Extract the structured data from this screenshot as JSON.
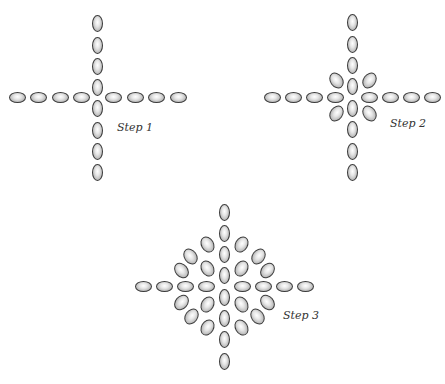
{
  "figure": {
    "steps": [
      {
        "id": "step1",
        "label": "Step 1",
        "label_pos": [
          117,
          128
        ],
        "beads": {
          "vertical": [
            [
              97,
              23
            ],
            [
              97,
              45
            ],
            [
              97,
              66
            ],
            [
              97,
              87
            ],
            [
              97,
              108
            ],
            [
              97,
              130
            ],
            [
              97,
              151
            ],
            [
              97,
              172
            ]
          ],
          "horizontal": [
            [
              17,
              97
            ],
            [
              38,
              97
            ],
            [
              60,
              97
            ],
            [
              81,
              97
            ],
            [
              113,
              97
            ],
            [
              135,
              97
            ],
            [
              156,
              97
            ],
            [
              178,
              97
            ]
          ],
          "diagonal": []
        }
      },
      {
        "id": "step2",
        "label": "Step 2",
        "label_pos": [
          392,
          124
        ],
        "beads": {
          "vertical": [
            [
              352,
              22
            ],
            [
              352,
              44
            ],
            [
              352,
              65
            ],
            [
              352,
              86
            ],
            [
              352,
              108
            ],
            [
              352,
              129
            ],
            [
              352,
              151
            ],
            [
              352,
              172
            ]
          ],
          "horizontal": [
            [
              272,
              97
            ],
            [
              293,
              97
            ],
            [
              314,
              97
            ],
            [
              335,
              97
            ],
            [
              369,
              97
            ],
            [
              390,
              97
            ],
            [
              411,
              97
            ],
            [
              432,
              97
            ]
          ],
          "diagonal": [
            [
              336,
              80,
              -35
            ],
            [
              369,
              80,
              35
            ],
            [
              336,
              113,
              35
            ],
            [
              369,
              113,
              -35
            ]
          ]
        }
      },
      {
        "id": "step3",
        "label": "Step 3",
        "label_pos": [
          283,
          316
        ],
        "beads": {
          "vertical": [
            [
              224,
              212
            ],
            [
              224,
              233
            ],
            [
              224,
              254
            ],
            [
              224,
              275
            ],
            [
              224,
              297
            ],
            [
              224,
              318
            ],
            [
              224,
              339
            ],
            [
              224,
              361
            ]
          ],
          "horizontal": [
            [
              143,
              286
            ],
            [
              164,
              286
            ],
            [
              185,
              286
            ],
            [
              206,
              286
            ],
            [
              242,
              286
            ],
            [
              263,
              286
            ],
            [
              284,
              286
            ],
            [
              305,
              286
            ]
          ],
          "diagonal": [
            [
              207,
              244,
              -30
            ],
            [
              241,
              244,
              30
            ],
            [
              190,
              256,
              -35
            ],
            [
              258,
              256,
              35
            ],
            [
              207,
              268,
              -30
            ],
            [
              241,
              268,
              30
            ],
            [
              181,
              270,
              -40
            ],
            [
              267,
              270,
              40
            ],
            [
              181,
              302,
              40
            ],
            [
              267,
              302,
              -40
            ],
            [
              207,
              304,
              30
            ],
            [
              241,
              304,
              -30
            ],
            [
              191,
              316,
              35
            ],
            [
              257,
              316,
              -35
            ],
            [
              207,
              327,
              30
            ],
            [
              241,
              327,
              -30
            ]
          ]
        }
      }
    ]
  }
}
